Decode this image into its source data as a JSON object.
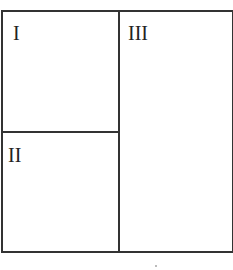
{
  "diagram": {
    "type": "partitioned-square",
    "regions": [
      {
        "id": "I",
        "label": "I",
        "position": "top-left"
      },
      {
        "id": "II",
        "label": "II",
        "position": "bottom-left"
      },
      {
        "id": "III",
        "label": "III",
        "position": "right"
      }
    ],
    "line_color": "#333333"
  }
}
